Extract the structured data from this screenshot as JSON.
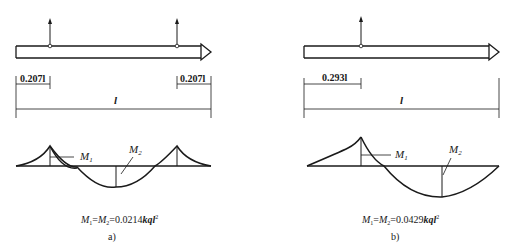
{
  "panels": [
    {
      "id": "a",
      "caption": "a)",
      "dim_left": "0.207l",
      "dim_right": "0.207l",
      "span_label": "l",
      "m1_label": "M",
      "m1_sub": "1",
      "m2_label": "M",
      "m2_sub": "2",
      "formula": {
        "m1": "M",
        "s1": "1",
        "eq1": "=",
        "m2": "M",
        "s2": "2",
        "eq2": "=0.0214",
        "kql": "kql",
        "exp": "2"
      }
    },
    {
      "id": "b",
      "caption": "b)",
      "dim_left": "0.293l",
      "span_label": "l",
      "m1_label": "M",
      "m1_sub": "1",
      "m2_label": "M",
      "m2_sub": "2",
      "formula": {
        "m1": "M",
        "s1": "1",
        "eq1": "=",
        "m2": "M",
        "s2": "2",
        "eq2": "=0.0429",
        "kql": "kql",
        "exp": "2"
      }
    }
  ]
}
